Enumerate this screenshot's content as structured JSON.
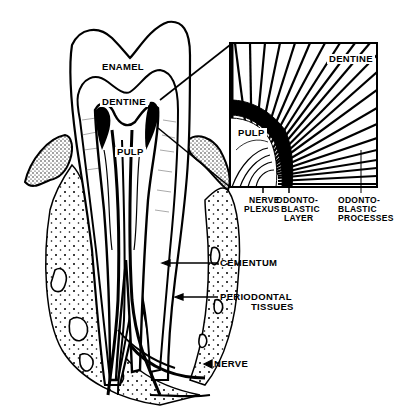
{
  "diagram": {
    "colors": {
      "ink": "#000000",
      "paper": "#ffffff"
    },
    "tooth_labels": {
      "enamel": "ENAMEL",
      "dentine": "DENTINE",
      "pulp": "PULP"
    },
    "inset": {
      "dentine": "DENTINE",
      "pulp": "PULP",
      "nerve_plexus": {
        "line1": "NERVE",
        "line2": "PLEXUS"
      },
      "odontoblastic_layer": {
        "line1": "ODONTO-",
        "line2": "BLASTIC",
        "line3": "LAYER"
      },
      "odontoblastic_processes": {
        "line1": "ODONTO-",
        "line2": "BLASTIC",
        "line3": "PROCESSES"
      }
    },
    "side_labels": {
      "cementum": "CEMENTUM",
      "periodontal": {
        "line1": "PERIODONTAL",
        "line2": "TISSUES"
      },
      "nerve": "NERVE"
    }
  }
}
